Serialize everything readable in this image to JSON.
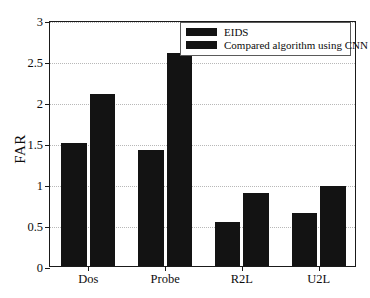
{
  "chart_data": {
    "type": "bar",
    "title": "",
    "xlabel": "",
    "ylabel": "FAR",
    "categories": [
      "Dos",
      "Probe",
      "R2L",
      "U2L"
    ],
    "series": [
      {
        "name": "EIDS",
        "values": [
          1.5,
          1.41,
          0.54,
          0.65
        ],
        "color": "#131313"
      },
      {
        "name": "Compared algorithm using CNN",
        "values": [
          2.1,
          2.6,
          0.89,
          0.97
        ],
        "color": "#131313"
      }
    ],
    "ylim": [
      0,
      3
    ],
    "ytick_labels": [
      "0",
      "0.5",
      "1",
      "1.5",
      "2",
      "2.5",
      "3"
    ],
    "ytick_values": [
      0,
      0.5,
      1,
      1.5,
      2,
      2.5,
      3
    ],
    "grid": true,
    "grid_style": "dotted",
    "grid_color": "#b8b8b8",
    "legend_position": "top-right",
    "axis_color": "#1a1a1a",
    "background_color": "#ffffff"
  },
  "legend": {
    "entries": [
      {
        "label": "EIDS"
      },
      {
        "label": "Compared algorithm using CNN"
      }
    ]
  }
}
